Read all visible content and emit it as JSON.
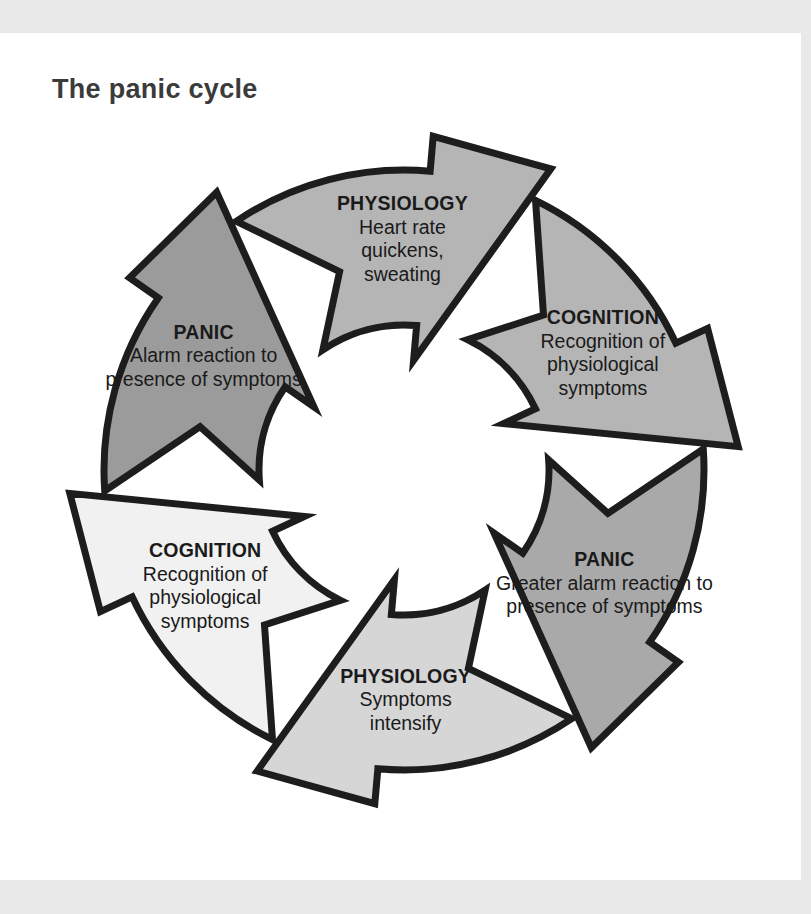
{
  "figure": {
    "title": "The panic cycle",
    "type": "cycle-diagram",
    "direction": "clockwise",
    "step_count": 6
  },
  "colors": {
    "page_margin": "#e9e9e9",
    "sheet": "#ffffff",
    "outline": "#1d1d1d",
    "title_text": "#3b3b3b",
    "label_text": "#1a1a1a"
  },
  "steps": [
    {
      "id": "panic-1",
      "position": "top",
      "heading": "PANIC",
      "line1": "Alarm reaction to",
      "line2": "presence of symptoms",
      "line3": "",
      "fill": "#9b9b9b"
    },
    {
      "id": "physiology-1",
      "position": "upper-right",
      "heading": "PHYSIOLOGY",
      "line1": "Heart rate",
      "line2": "quickens,",
      "line3": "sweating",
      "fill": "#b5b5b5"
    },
    {
      "id": "cognition-1",
      "position": "lower-right",
      "heading": "COGNITION",
      "line1": "Recognition of",
      "line2": "physiological",
      "line3": "symptoms",
      "fill": "#b5b5b5"
    },
    {
      "id": "panic-2",
      "position": "bottom",
      "heading": "PANIC",
      "line1": "Greater alarm reaction to",
      "line2": "presence of symptoms",
      "line3": "",
      "fill": "#a9a9a9"
    },
    {
      "id": "physiology-2",
      "position": "lower-left",
      "heading": "PHYSIOLOGY",
      "line1": "Symptoms",
      "line2": "intensify",
      "line3": "",
      "fill": "#d6d6d6"
    },
    {
      "id": "cognition-2",
      "position": "upper-left",
      "heading": "COGNITION",
      "line1": "Recognition of",
      "line2": "physiological",
      "line3": "symptoms",
      "fill": "#f1f1f1"
    }
  ]
}
